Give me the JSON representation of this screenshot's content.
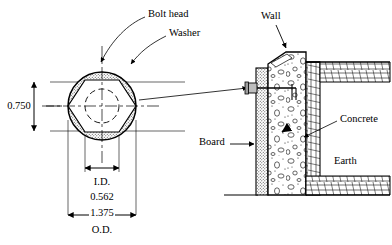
{
  "figure": {
    "background_color": "#ffffff",
    "line_color": "#000000"
  },
  "left_detail": {
    "name": "washer-plan-view",
    "callouts": [
      {
        "id": "bolt-head",
        "label": "Bolt head"
      },
      {
        "id": "washer",
        "label": "Washer"
      }
    ],
    "dimensions": [
      {
        "id": "across-flats",
        "value": "0.750",
        "orientation": "vertical"
      },
      {
        "id": "inner-diameter-label",
        "value": "I.D."
      },
      {
        "id": "inner-diameter-value",
        "value": "0.562"
      },
      {
        "id": "outer-diameter-value",
        "value": "1.375"
      },
      {
        "id": "outer-diameter-label",
        "value": "O.D."
      }
    ],
    "geometry": {
      "center_x": 102,
      "center_y": 106,
      "washer_outer_radius": 34,
      "hex_across_flats": 51,
      "bolt_hole_radius": 17
    }
  },
  "right_detail": {
    "name": "wall-section-view",
    "callouts": [
      {
        "id": "wall",
        "label": "Wall"
      },
      {
        "id": "board",
        "label": "Board"
      },
      {
        "id": "concrete",
        "label": "Concrete"
      },
      {
        "id": "earth",
        "label": "Earth"
      }
    ]
  },
  "colors": {
    "stipple_fill": "#d9d9d9",
    "concrete_fill": "#efefef",
    "earth_fill": "#ffffff",
    "ink": "#000000"
  }
}
